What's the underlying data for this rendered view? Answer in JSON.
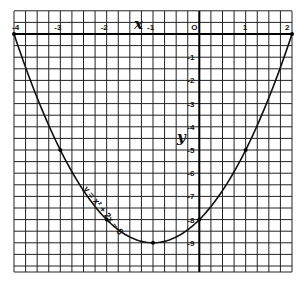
{
  "chart_data": {
    "type": "line",
    "title": "",
    "xlabel": "x",
    "ylabel": "y",
    "equation_label": "y = x² + 2x − 8",
    "function": "y = x^2 + 2x - 8",
    "xlim": [
      -4,
      2
    ],
    "ylim": [
      -10.25,
      1
    ],
    "x_ticks": [
      "-4",
      "-3",
      "-2",
      "-1",
      "0",
      "1",
      "2"
    ],
    "y_ticks": [
      "-1",
      "-2",
      "-3",
      "-4",
      "-5",
      "-6",
      "-7",
      "-8",
      "-9"
    ],
    "grid": true,
    "series": [
      {
        "name": "y = x² + 2x − 8",
        "x": [
          -4,
          -3,
          -2,
          -1,
          0,
          1,
          2
        ],
        "y": [
          0,
          -5,
          -8,
          -9,
          -8,
          -5,
          0
        ]
      }
    ],
    "marked_points": [
      {
        "x": -4,
        "y": 0
      },
      {
        "x": -3,
        "y": -5
      },
      {
        "x": -2,
        "y": -8
      },
      {
        "x": -1,
        "y": -9
      },
      {
        "x": 0,
        "y": -8
      },
      {
        "x": 1,
        "y": -5
      },
      {
        "x": 2,
        "y": 0
      }
    ],
    "vertex": {
      "x": -1,
      "y": -9
    }
  }
}
